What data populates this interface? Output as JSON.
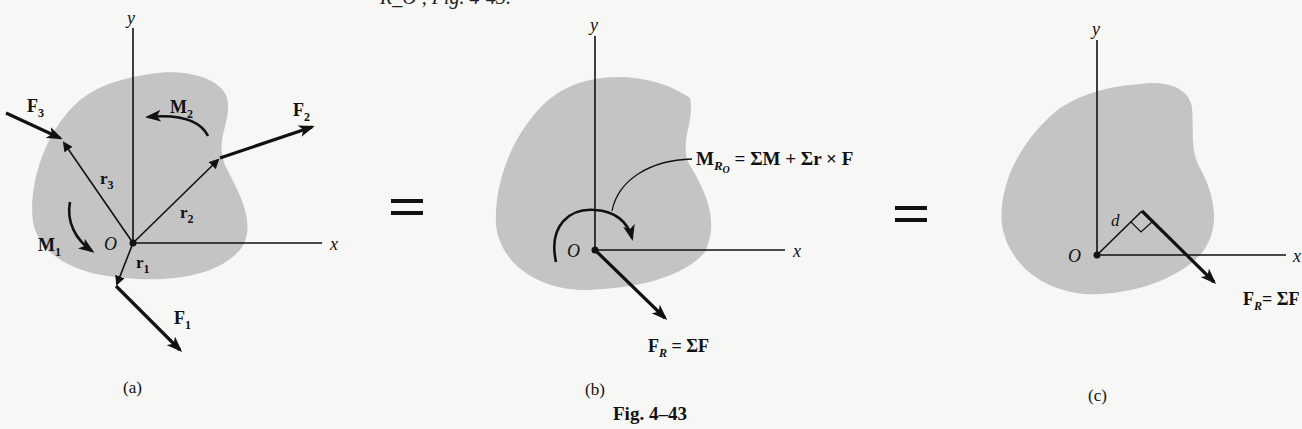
{
  "top_clip_text": "R_O   ,  Fig. 4-43.",
  "figure_caption": "Fig. 4–43",
  "colors": {
    "body_fill": "#c4c4c4",
    "ink": "#111111",
    "background": "#f7f7f5"
  },
  "panels": [
    {
      "id": "a",
      "label": "(a)",
      "axes": {
        "x": "x",
        "y": "y",
        "origin": "O"
      },
      "forces": [
        {
          "name": "F1",
          "label": "F",
          "sub": "1"
        },
        {
          "name": "F2",
          "label": "F",
          "sub": "2"
        },
        {
          "name": "F3",
          "label": "F",
          "sub": "3"
        }
      ],
      "position_vectors": [
        {
          "name": "r1",
          "label": "r",
          "sub": "1"
        },
        {
          "name": "r2",
          "label": "r",
          "sub": "2"
        },
        {
          "name": "r3",
          "label": "r",
          "sub": "3"
        }
      ],
      "couple_moments": [
        {
          "name": "M1",
          "label": "M",
          "sub": "1",
          "direction": "clockwise"
        },
        {
          "name": "M2",
          "label": "M",
          "sub": "2",
          "direction": "counterclockwise"
        }
      ]
    },
    {
      "id": "b",
      "label": "(b)",
      "axes": {
        "x": "x",
        "y": "y",
        "origin": "O"
      },
      "resultant_moment": {
        "lhs": "M",
        "lhs_sub": "R",
        "lhs_subsub": "O",
        "rhs": " = ΣM + Σr × F"
      },
      "resultant_force": {
        "lhs": "F",
        "lhs_sub": "R",
        "rhs": " = ΣF"
      }
    },
    {
      "id": "c",
      "label": "(c)",
      "axes": {
        "x": "x",
        "y": "y",
        "origin": "O"
      },
      "distance": "d",
      "resultant_force": {
        "lhs": "F",
        "lhs_sub": "R",
        "rhs": "= ΣF"
      }
    }
  ],
  "equals": [
    "=",
    "="
  ]
}
